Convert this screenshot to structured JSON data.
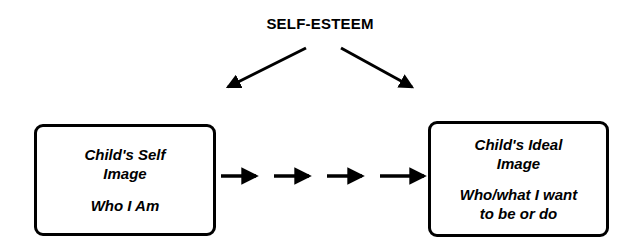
{
  "diagram": {
    "title": "SELF-ESTEEM",
    "background_color": "#ffffff",
    "stroke_color": "#000000",
    "boxes": [
      {
        "id": "self-image",
        "heading_line_1": "Child's Self",
        "heading_line_2": "Image",
        "caption_line_1": "Who I Am",
        "caption_line_2": ""
      },
      {
        "id": "ideal-image",
        "heading_line_1": "Child's Ideal",
        "heading_line_2": "Image",
        "caption_line_1": "Who/what I want",
        "caption_line_2": "to be or do"
      }
    ],
    "connectors": {
      "diverging_arrow_count": 2,
      "progression_arrow_count": 4,
      "progression_direction": "left-to-right"
    }
  }
}
